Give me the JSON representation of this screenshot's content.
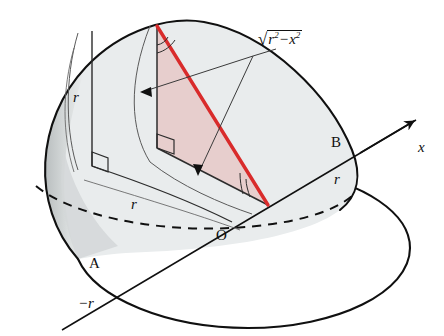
{
  "figure": {
    "kind": "solid-geometry-diagram",
    "background_color": "#ffffff"
  },
  "colors": {
    "outline": "#101010",
    "surface_fill": "#e9eced",
    "surface_fill_dark": "#c9cdce",
    "section_fill": "#e7cecd",
    "accent_red": "#d92b2b",
    "thin_line": "#4a4a4a"
  },
  "labels": {
    "axis_x": "x",
    "point_o": "O",
    "point_a": "A",
    "point_b": "B",
    "coord_neg_r": "−r",
    "coord_pos_r": "r",
    "radius_vertical": "r",
    "radius_horizontal": "r",
    "height_expr": {
      "radical_sign": "√",
      "base1": "r",
      "exp1": "2",
      "minus": "−",
      "base2": "x",
      "exp2": "2",
      "plain": "√(r² − x²)"
    }
  },
  "annotations": {
    "right_angle_marks": 2,
    "angle_arc_marks": 2,
    "arrowheads": 3,
    "dashed_curve": "hidden rim of base circle"
  }
}
